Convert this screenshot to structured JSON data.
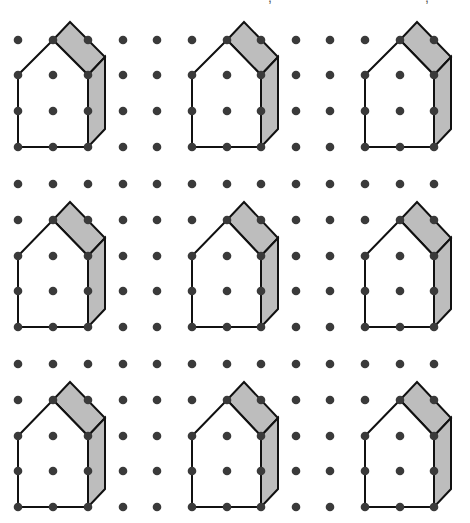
{
  "figure": {
    "type": "isometric-dot-grid-worksheet",
    "grid": {
      "columns_x": [
        18,
        53,
        88,
        123,
        157,
        192,
        227,
        261,
        296,
        330,
        365,
        400,
        434
      ],
      "rows_y": [
        40,
        75,
        111,
        147,
        184,
        220,
        256,
        291,
        327,
        364,
        400,
        436,
        471,
        507
      ],
      "dot_radius": 4.3,
      "dot_color": "#3a3a3a"
    },
    "house": {
      "front_face_grid": [
        [
          1,
          0
        ],
        [
          0,
          1
        ],
        [
          0,
          3
        ],
        [
          2,
          3
        ],
        [
          2,
          1
        ]
      ],
      "extrusion_offset": [
        17,
        -18
      ],
      "front_fill": "#ffffff",
      "shade_fill": "#bdbdbd",
      "stroke": "#111111"
    },
    "houses": [
      {
        "col": 0,
        "row": 0
      },
      {
        "col": 5,
        "row": 0
      },
      {
        "col": 10,
        "row": 0
      },
      {
        "col": 0,
        "row": 5
      },
      {
        "col": 5,
        "row": 5
      },
      {
        "col": 10,
        "row": 5
      },
      {
        "col": 0,
        "row": 10
      },
      {
        "col": 5,
        "row": 10
      },
      {
        "col": 10,
        "row": 10
      }
    ],
    "house_origin_note": "col/row refer to the grid index of the house's left wall column and apex row",
    "top_text_fragments": [
      {
        "x": 268,
        "text": ","
      },
      {
        "x": 425,
        "text": ","
      }
    ]
  }
}
